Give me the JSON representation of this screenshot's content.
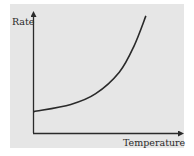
{
  "chart_data": {
    "type": "line",
    "title": "",
    "xlabel": "Temperature",
    "ylabel": "Rate",
    "grid": false,
    "legend": null,
    "axis_ticks": false,
    "series": [
      {
        "name": "Rate vs Temperature",
        "x": [
          0,
          0.25,
          0.42,
          0.58,
          0.68,
          0.76
        ],
        "y": [
          0.18,
          0.24,
          0.33,
          0.51,
          0.73,
          0.98
        ]
      }
    ],
    "xlim": [
      0,
      1
    ],
    "ylim": [
      0,
      1
    ]
  },
  "colors": {
    "panel_background": "#e6e6e6",
    "page_background": "#ffffff",
    "axis": "#2a2a2a",
    "curve": "#2a2a2a"
  }
}
